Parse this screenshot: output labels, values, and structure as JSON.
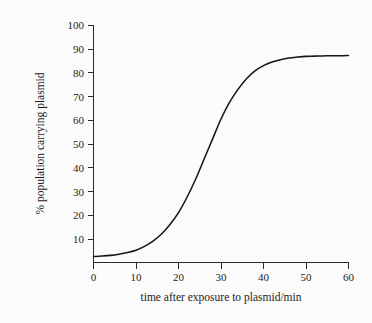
{
  "chart_data": {
    "type": "line",
    "title": "",
    "subtitle": "",
    "xlabel": "time after exposure to plasmid/min",
    "ylabel": "% population carrying plasmid",
    "xlim": [
      0,
      60
    ],
    "ylim": [
      0,
      100
    ],
    "xticks": [
      0,
      10,
      20,
      30,
      40,
      50,
      60
    ],
    "xtick_labels": [
      "0",
      "10",
      "20",
      "30",
      "40",
      "50",
      "60"
    ],
    "yticks": [
      10,
      20,
      30,
      40,
      50,
      60,
      70,
      80,
      90,
      100
    ],
    "ytick_labels": [
      "10",
      "20",
      "30",
      "40",
      "50",
      "60",
      "70",
      "80",
      "90",
      "100"
    ],
    "grid": false,
    "legend": false,
    "legend_position": "none",
    "annotations": [],
    "series": [
      {
        "name": "% population carrying plasmid",
        "color": "#15161a",
        "marker": "none",
        "x": [
          0,
          2,
          4,
          6,
          8,
          10,
          12,
          14,
          16,
          18,
          20,
          22,
          24,
          26,
          28,
          30,
          32,
          34,
          36,
          38,
          40,
          42,
          44,
          46,
          48,
          50,
          52,
          54,
          56,
          58,
          60
        ],
        "values": [
          2.5,
          2.7,
          3.0,
          3.5,
          4.2,
          5.2,
          6.8,
          9.0,
          12.0,
          16.0,
          21.0,
          27.5,
          35.0,
          43.5,
          52.0,
          60.5,
          67.5,
          73.0,
          77.5,
          80.8,
          83.0,
          84.5,
          85.5,
          86.2,
          86.6,
          86.9,
          87.0,
          87.1,
          87.2,
          87.2,
          87.3
        ]
      }
    ]
  },
  "axes": {
    "x_title": "time after exposure to plasmid/min",
    "y_title": "% population carrying plasmid"
  },
  "ticks": {
    "x": [
      "0",
      "10",
      "20",
      "30",
      "40",
      "50",
      "60"
    ],
    "y": [
      "100",
      "90",
      "80",
      "70",
      "60",
      "50",
      "40",
      "30",
      "20",
      "10"
    ]
  },
  "colors": {
    "background": "#fbfbfb",
    "axis": "#2a2a2a",
    "curve": "#15161a",
    "text": "#1d1d1d"
  }
}
